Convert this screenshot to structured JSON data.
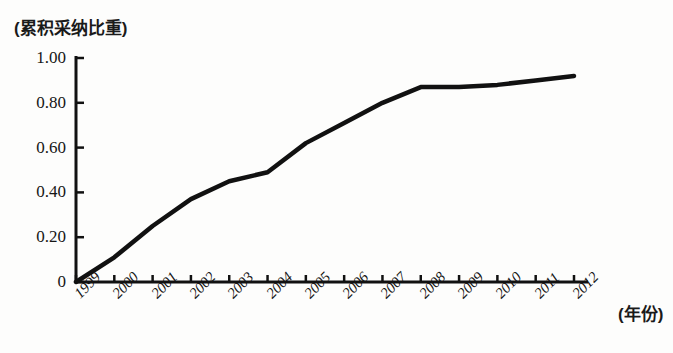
{
  "chart_data": {
    "type": "line",
    "title": "(累积采纳比重)",
    "ylabel": "(累积采纳比重)",
    "xlabel": "(年份)",
    "categories": [
      "1999",
      "2000",
      "2001",
      "2002",
      "2003",
      "2004",
      "2005",
      "2006",
      "2007",
      "2008",
      "2009",
      "2010",
      "2011",
      "2012"
    ],
    "values": [
      0.0,
      0.11,
      0.25,
      0.37,
      0.45,
      0.49,
      0.62,
      0.71,
      0.8,
      0.87,
      0.87,
      0.88,
      0.9,
      0.92
    ],
    "series": [
      {
        "name": "累积采纳比重",
        "values": [
          0.0,
          0.11,
          0.25,
          0.37,
          0.45,
          0.49,
          0.62,
          0.71,
          0.8,
          0.87,
          0.87,
          0.88,
          0.9,
          0.92
        ]
      }
    ],
    "ylim": [
      0,
      1.0
    ],
    "ytick_labels": [
      "0",
      "0.20",
      "0.40",
      "0.60",
      "0.80",
      "1.00"
    ],
    "ytick_values": [
      0,
      0.2,
      0.4,
      0.6,
      0.8,
      1.0
    ],
    "xtick_labels": [
      "1999",
      "2000",
      "2001",
      "2002",
      "2003",
      "2004",
      "2005",
      "2006",
      "2007",
      "2008",
      "2009",
      "2010",
      "2011",
      "2012"
    ],
    "grid": false,
    "legend": "none",
    "line_color": "#111111",
    "line_width": 4.5
  },
  "figure": {
    "background": "#fdfdfc",
    "axis_color": "#111111"
  }
}
